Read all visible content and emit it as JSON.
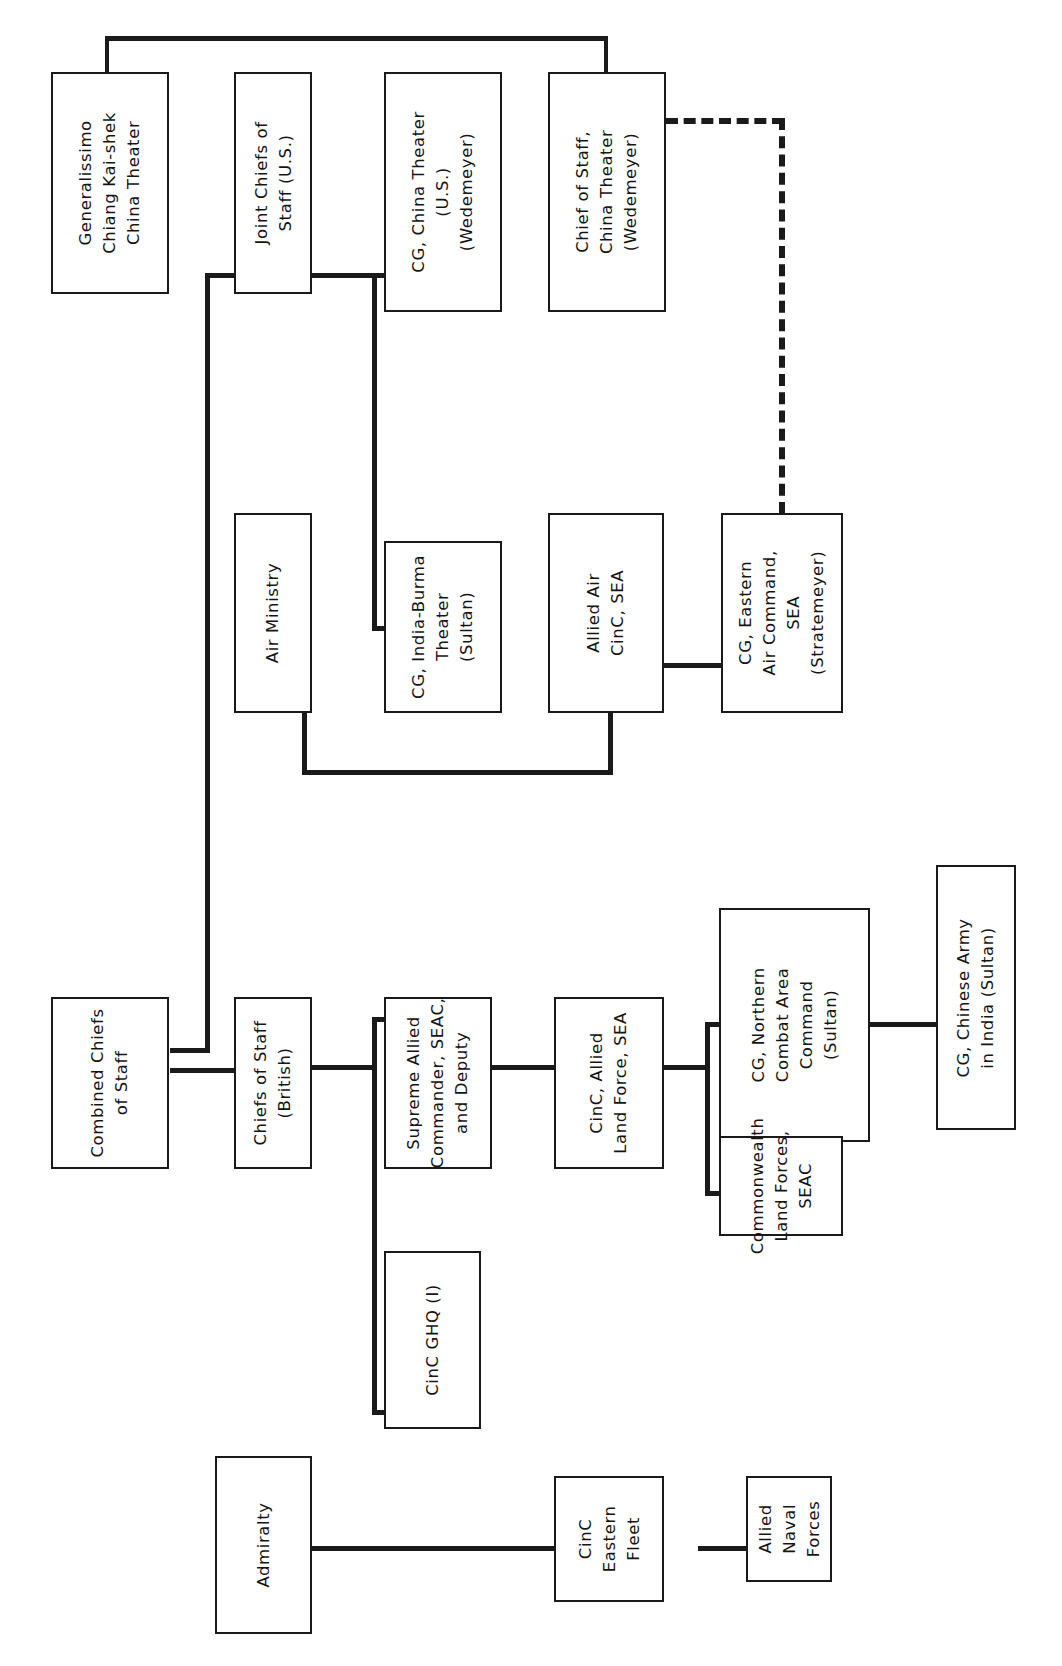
{
  "diagram": {
    "orientation": "text-rotated-90ccw",
    "line_color": "#1a1a1a",
    "background_color": "#ffffff",
    "boxes": [
      {
        "id": "generalissimo",
        "label": "Generalissimo\nChiang Kai-shek\nChina Theater"
      },
      {
        "id": "jcs",
        "label": "Joint Chiefs of\nStaff (U.S.)"
      },
      {
        "id": "cg_china",
        "label": "CG, China Theater\n(U.S.)\n(Wedemeyer)"
      },
      {
        "id": "cos_china",
        "label": "Chief of Staff,\nChina Theater\n(Wedemeyer)"
      },
      {
        "id": "air_ministry",
        "label": "Air Ministry"
      },
      {
        "id": "cg_india_burma",
        "label": "CG, India-Burma\nTheater\n(Sultan)"
      },
      {
        "id": "allied_air_cinc",
        "label": "Allied Air\nCinC, SEA"
      },
      {
        "id": "cg_eastern_air",
        "label": "CG, Eastern\nAir Command,\nSEA\n(Stratemeyer)"
      },
      {
        "id": "combined_chiefs",
        "label": "Combined Chiefs\nof Staff"
      },
      {
        "id": "cos_british",
        "label": "Chiefs of Staff\n(British)"
      },
      {
        "id": "supreme_allied",
        "label": "Supreme Allied\nCommander, SEAC,\nand Deputy"
      },
      {
        "id": "cinc_land_force",
        "label": "CinC, Allied\nLand Force, SEA"
      },
      {
        "id": "cg_ncac",
        "label": "CG, Northern\nCombat Area\nCommand\n(Sultan)"
      },
      {
        "id": "commonwealth",
        "label": "Commonwealth\nLand Forces,\nSEAC"
      },
      {
        "id": "cg_chinese_army",
        "label": "CG, Chinese Army\nin India (Sultan)"
      },
      {
        "id": "admiralty",
        "label": "Admiralty"
      },
      {
        "id": "cinc_ghq",
        "label": "CinC GHQ (I)"
      },
      {
        "id": "cinc_eastern_fleet",
        "label": "CinC\nEastern\nFleet"
      },
      {
        "id": "allied_naval",
        "label": "Allied\nNaval\nForces"
      }
    ],
    "connections": [
      {
        "from": "generalissimo",
        "to": "cos_china",
        "style": "solid"
      },
      {
        "from": "jcs",
        "to": "cg_china",
        "style": "solid"
      },
      {
        "from": "jcs",
        "to": "cg_india_burma",
        "style": "solid"
      },
      {
        "from": "jcs",
        "to": "combined_chiefs",
        "style": "solid"
      },
      {
        "from": "cos_china",
        "to": "cg_eastern_air",
        "style": "dashed"
      },
      {
        "from": "air_ministry",
        "to": "allied_air_cinc",
        "style": "solid"
      },
      {
        "from": "allied_air_cinc",
        "to": "cg_eastern_air",
        "style": "solid"
      },
      {
        "from": "combined_chiefs",
        "to": "cos_british",
        "style": "solid"
      },
      {
        "from": "cos_british",
        "to": "supreme_allied",
        "style": "solid"
      },
      {
        "from": "cos_british",
        "to": "air_ministry",
        "style": "solid"
      },
      {
        "from": "supreme_allied",
        "to": "cinc_land_force",
        "style": "solid"
      },
      {
        "from": "supreme_allied",
        "to": "cinc_ghq",
        "style": "solid"
      },
      {
        "from": "cinc_land_force",
        "to": "cg_ncac",
        "style": "solid"
      },
      {
        "from": "cinc_land_force",
        "to": "commonwealth",
        "style": "solid"
      },
      {
        "from": "cg_ncac",
        "to": "cg_chinese_army",
        "style": "solid"
      },
      {
        "from": "admiralty",
        "to": "cinc_eastern_fleet",
        "style": "solid"
      },
      {
        "from": "cinc_eastern_fleet",
        "to": "allied_naval",
        "style": "solid"
      }
    ]
  }
}
